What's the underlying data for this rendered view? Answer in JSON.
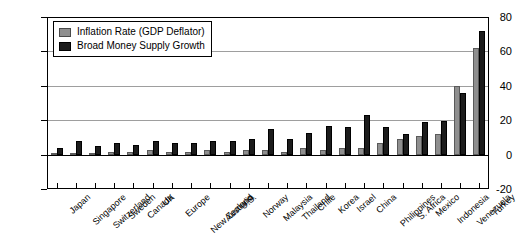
{
  "chart_data": {
    "type": "bar",
    "title": "",
    "xlabel": "",
    "ylabel": "",
    "ylim": [
      -20,
      80
    ],
    "yticks": [
      -20,
      0,
      20,
      40,
      60,
      80
    ],
    "grid": true,
    "legend_position": "top-left",
    "categories": [
      "Japan",
      "Singapore",
      "Switzerland",
      "Sweden",
      "Canada",
      "UK",
      "Europe",
      "New Zealand",
      "Australia",
      "U.S.",
      "Norway",
      "Malaysia",
      "Thailand",
      "Chile",
      "Korea",
      "Israel",
      "China",
      "Philippines",
      "S. Africa",
      "Mexico",
      "Indonesia",
      "Venezuela",
      "Turkey"
    ],
    "series": [
      {
        "name": "Inflation Rate (GDP Deflator)",
        "color": "#8f8f8f",
        "values": [
          1,
          1,
          1,
          2,
          2,
          3,
          2,
          2,
          3,
          2,
          3,
          3,
          2,
          4,
          3,
          4,
          4,
          7,
          9,
          11,
          12,
          40,
          62
        ]
      },
      {
        "name": "Broad Money Supply Growth",
        "color": "#1c1c1c",
        "values": [
          4,
          8,
          5,
          7,
          6,
          8,
          7,
          7,
          8,
          8,
          9,
          15,
          9,
          13,
          17,
          16,
          23,
          16,
          12,
          19,
          20,
          36,
          72
        ]
      }
    ]
  },
  "legend": {
    "items": [
      {
        "label": "Inflation Rate (GDP Deflator)",
        "swatch": "inflation"
      },
      {
        "label": "Broad Money Supply Growth",
        "swatch": "money"
      }
    ]
  },
  "axis": {
    "y_tick_labels": [
      "80",
      "60",
      "40",
      "20",
      "0",
      "-20"
    ]
  }
}
